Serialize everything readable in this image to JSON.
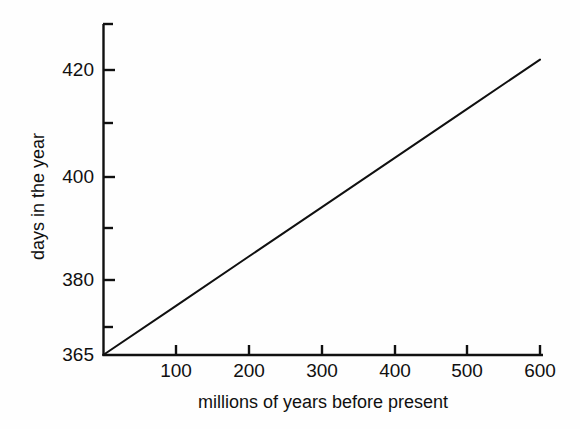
{
  "figure": {
    "background_color": "#fefefe",
    "ink_color": "#101010"
  },
  "chart_data": {
    "type": "line",
    "title": "",
    "subtitle": "",
    "xlabel": "millions of years before present",
    "ylabel": "days in the year",
    "xlim": [
      0,
      610
    ],
    "ylim": [
      365,
      430
    ],
    "grid": false,
    "legend": null,
    "x_ticks": [
      100,
      200,
      300,
      400,
      500,
      600
    ],
    "x_tick_labels": [
      "100",
      "200",
      "300",
      "400",
      "500",
      "600"
    ],
    "x_minor_ticks": [],
    "y_ticks": [
      365,
      380,
      400,
      420
    ],
    "y_tick_labels": [
      "365",
      "380",
      "400",
      "420"
    ],
    "y_minor_ticks": [
      370,
      390,
      410,
      430
    ],
    "series": [
      {
        "name": "length of year",
        "x": [
          0,
          100,
          200,
          300,
          400,
          500,
          600
        ],
        "values": [
          365,
          374.5,
          384,
          393.5,
          403,
          412.5,
          422
        ],
        "color": "#101010",
        "line_width": 2,
        "marker": "none"
      }
    ],
    "annotations": []
  },
  "axis_titles": {
    "x": "millions of years before present",
    "y": "days in the year"
  }
}
